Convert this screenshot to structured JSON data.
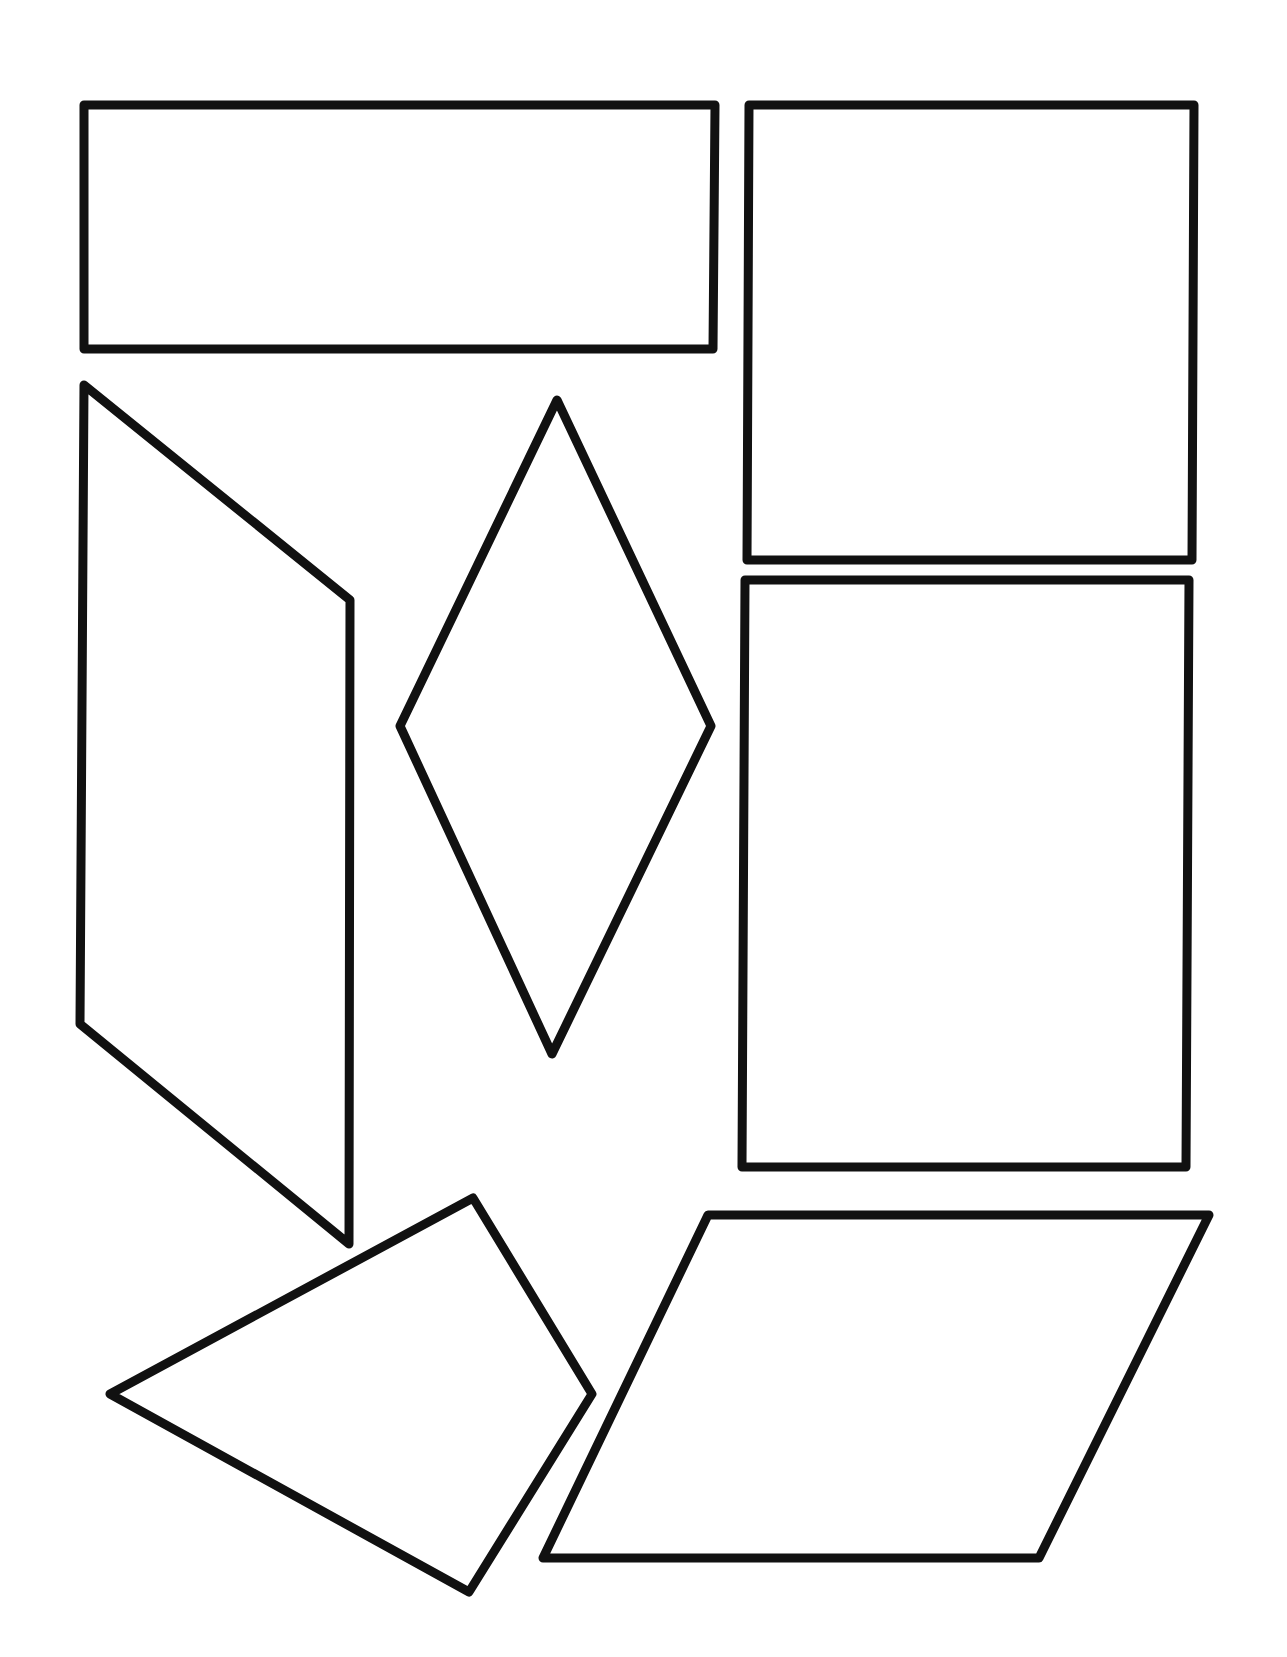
{
  "canvas": {
    "width": 1287,
    "height": 1657,
    "background": "#ffffff"
  },
  "style": {
    "stroke": "#111111",
    "fill": "#ffffff",
    "stroke_width": 9
  },
  "shapes": [
    {
      "id": "wide-rectangle",
      "type": "rectangle",
      "points": "84,105 715,105 713,349 84,349"
    },
    {
      "id": "tall-rectangle-upper-right",
      "type": "rectangle",
      "points": "749,105 1194,105 1192,560 747,560"
    },
    {
      "id": "tall-rectangle-lower-right",
      "type": "rectangle",
      "points": "745,580 1189,580 1186,1167 742,1167"
    },
    {
      "id": "parallelogram-left",
      "type": "parallelogram",
      "points": "84,385 350,600 349,1244 80,1024"
    },
    {
      "id": "rhombus-center",
      "type": "rhombus",
      "points": "557,400 711,726 552,1054 400,726"
    },
    {
      "id": "kite-bottom-left",
      "type": "kite",
      "points": "473,1198 592,1394 469,1592 110,1394"
    },
    {
      "id": "parallelogram-bottom-right",
      "type": "parallelogram",
      "points": "708,1215 1209,1215 1039,1558 543,1558"
    }
  ]
}
